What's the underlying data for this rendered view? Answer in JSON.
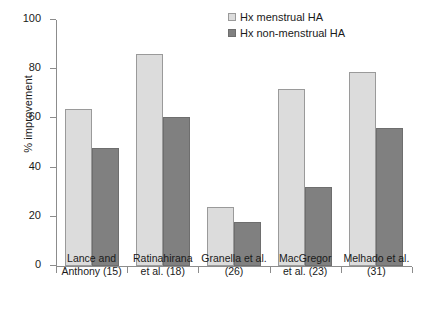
{
  "chart_data": {
    "type": "bar",
    "title": "",
    "xlabel": "",
    "ylabel": "% improvement",
    "ylim": [
      0,
      100
    ],
    "yticks": [
      0,
      20,
      40,
      60,
      80,
      100
    ],
    "grid": false,
    "legend_position": "top-right",
    "categories": [
      "Lance and\nAnthony (15)",
      "Ratinahirana\net al. (18)",
      "Granella et al.\n(26)",
      "MacGregor\net al. (23)",
      "Melhado et al.\n(31)"
    ],
    "series": [
      {
        "name": "Hx menstrual HA",
        "color": "#dcdcdc",
        "values": [
          64,
          86,
          24,
          72,
          79
        ]
      },
      {
        "name": "Hx non-menstrual HA",
        "color": "#808080",
        "values": [
          48,
          60.5,
          18,
          32,
          56
        ]
      }
    ]
  },
  "legend": {
    "items": [
      {
        "label": "Hx menstrual HA",
        "swatch": "light"
      },
      {
        "label": "Hx non-menstrual HA",
        "swatch": "dark"
      }
    ]
  },
  "axis": {
    "y_title": "% improvement",
    "y_tick_labels": [
      "100",
      "80",
      "60",
      "40",
      "20",
      "0"
    ]
  },
  "caption_strip": {
    "text": ""
  }
}
